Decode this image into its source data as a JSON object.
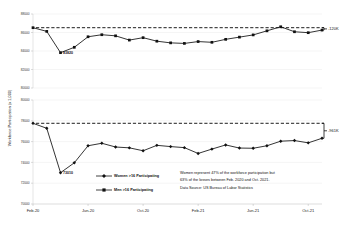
{
  "chart_data": [
    {
      "id": "men",
      "type": "line",
      "title": "",
      "xlabel": "",
      "ylabel": "Workforce Participation (x 1,000)",
      "legend_name": "Men >16 Participating",
      "ylim": [
        80000,
        88000
      ],
      "yticks": [
        80000,
        82000,
        84000,
        86000,
        88000
      ],
      "ytick_labels": [
        "80000",
        "82000",
        "84000",
        "86000",
        "88000"
      ],
      "grid": true,
      "x": [
        "Feb-20",
        "Mar-20",
        "Apr-20",
        "May-20",
        "Jun-20",
        "Jul-20",
        "Aug-20",
        "Sep-20",
        "Oct-20",
        "Nov-20",
        "Dec-20",
        "Jan-21",
        "Feb-21",
        "Mar-21",
        "Apr-21",
        "May-21",
        "Jun-21",
        "Jul-21",
        "Aug-21",
        "Sep-21",
        "Oct-21",
        "Nov-21"
      ],
      "xtick_labels": [
        "Feb-20",
        "Jun-20",
        "Oct-20",
        "Feb-21",
        "Jun-21",
        "Oct-21"
      ],
      "values": [
        86520,
        86120,
        83820,
        84400,
        85540,
        85760,
        85640,
        85180,
        85440,
        85060,
        84880,
        84820,
        85020,
        84940,
        85260,
        85500,
        85740,
        86180,
        86620,
        86080,
        85980,
        86260
      ],
      "reference_line": 86520,
      "point_label": {
        "x": "Apr-20",
        "value": 83820,
        "text": "83820"
      },
      "delta_label": "-120K"
    },
    {
      "id": "women",
      "type": "line",
      "title": "",
      "xlabel": "",
      "ylabel": "Workforce Participation (x 1,000)",
      "legend_name": "Women >16 Participating",
      "ylim": [
        70000,
        80000
      ],
      "yticks": [
        70000,
        72000,
        74000,
        76000,
        78000,
        80000
      ],
      "ytick_labels": [
        "70000",
        "72000",
        "74000",
        "76000",
        "78000",
        "80000"
      ],
      "grid": true,
      "x": [
        "Feb-20",
        "Mar-20",
        "Apr-20",
        "May-20",
        "Jun-20",
        "Jul-20",
        "Aug-20",
        "Sep-20",
        "Oct-20",
        "Nov-20",
        "Dec-20",
        "Jan-21",
        "Feb-21",
        "Mar-21",
        "Apr-21",
        "May-21",
        "Jun-21",
        "Jul-21",
        "Aug-21",
        "Sep-21",
        "Oct-21",
        "Nov-21"
      ],
      "xtick_labels": [
        "Feb-20",
        "Jun-20",
        "Oct-20",
        "Feb-21",
        "Jun-21",
        "Oct-21"
      ],
      "values": [
        77760,
        77280,
        73010,
        73960,
        75600,
        75840,
        75480,
        75400,
        75120,
        75640,
        75520,
        75420,
        74860,
        75280,
        75680,
        75380,
        75360,
        75600,
        76040,
        76100,
        75880,
        76320
      ],
      "reference_line": 77760,
      "point_label": {
        "x": "Apr-20",
        "value": 73010,
        "text": "73010"
      },
      "delta_label": "-961K"
    }
  ],
  "annotation": {
    "line1": "Women represent 47% of the workforce participation but",
    "line2": "63% of the losses between Feb. 2020 and Oct. 2021.",
    "line3": "Data Source: US Bureau of Labor Statistics"
  },
  "colors": {
    "series": "#111111",
    "grid": "#e2e2e2",
    "text": "#1a1a1a"
  }
}
